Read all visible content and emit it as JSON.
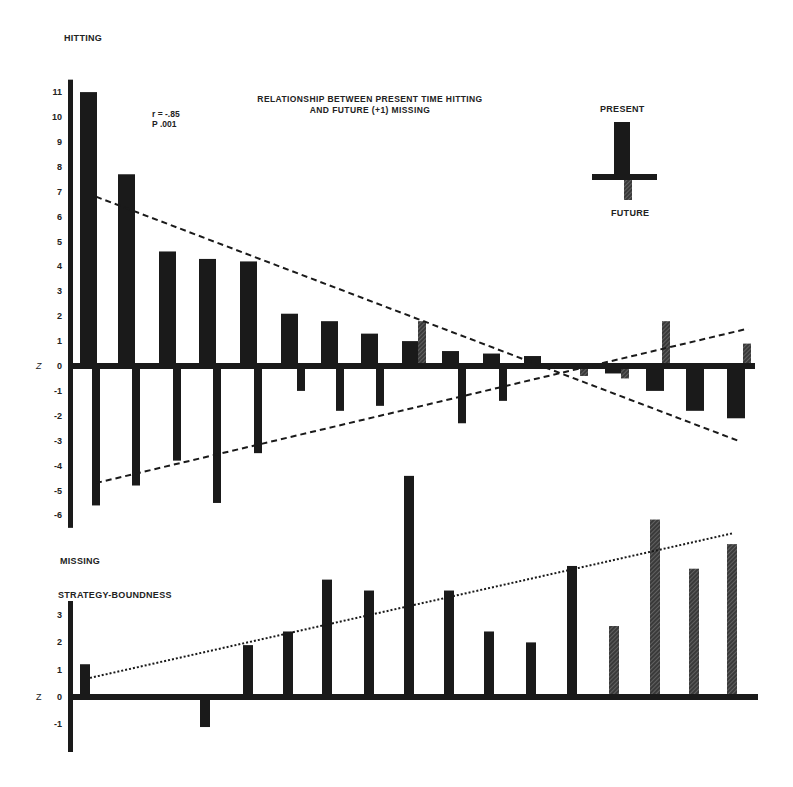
{
  "title": {
    "line1": "RELATIONSHIP BETWEEN PRESENT TIME HITTING",
    "line2": "AND FUTURE (+1) MISSING"
  },
  "stats": {
    "r": "r = -.85",
    "p": "P .001"
  },
  "legend": {
    "top_label": "PRESENT",
    "bottom_label": "FUTURE"
  },
  "labels": {
    "hitting": "HITTING",
    "missing": "MISSING",
    "strategy": "STRATEGY-BOUNDNESS",
    "z_top": "Z",
    "z_bottom": "Z"
  },
  "colors": {
    "ink": "#1a1a1a",
    "hatched": "#3a3a3a",
    "background": "#ffffff"
  },
  "chart_data": [
    {
      "type": "bar",
      "title": "RELATIONSHIP BETWEEN PRESENT TIME HITTING AND FUTURE (+1) MISSING",
      "xlabel": "",
      "ylabel": "HITTING (up) / MISSING (down), Z",
      "ylim": [
        -6,
        11
      ],
      "yticks": [
        11,
        10,
        9,
        8,
        7,
        6,
        5,
        4,
        3,
        2,
        1,
        0,
        -1,
        -2,
        -3,
        -4,
        -5,
        -6
      ],
      "grid": false,
      "legend_position": "top-right",
      "annotations": [
        "r = -.85",
        "P .001"
      ],
      "categories": [
        "1",
        "2",
        "3",
        "4",
        "5",
        "6",
        "7",
        "8",
        "9",
        "10",
        "11",
        "12",
        "13",
        "14",
        "15",
        "16"
      ],
      "series": [
        {
          "name": "PRESENT (Hitting)",
          "style": "solid",
          "values": [
            11.0,
            7.7,
            4.6,
            4.3,
            4.2,
            2.1,
            1.8,
            1.3,
            1.0,
            0.6,
            0.5,
            0.4,
            0.1,
            -0.3,
            -1.0,
            -1.8,
            -2.1
          ]
        },
        {
          "name": "FUTURE +1 (Missing)",
          "style": "hatched",
          "values": [
            -5.6,
            -4.8,
            -3.8,
            -5.5,
            -3.5,
            -1.0,
            -1.8,
            -1.6,
            1.8,
            -2.3,
            -1.4,
            0.0,
            -0.4,
            -0.5,
            1.8,
            0.9
          ]
        }
      ],
      "trendlines": [
        {
          "name": "Hitting trend",
          "style": "dashed",
          "from": [
            1,
            6.8
          ],
          "to": [
            16,
            -3.0
          ]
        },
        {
          "name": "Missing trend",
          "style": "dashed",
          "from": [
            1,
            -4.7
          ],
          "to": [
            16,
            1.5
          ]
        }
      ]
    },
    {
      "type": "bar",
      "title": "STRATEGY-BOUNDNESS",
      "xlabel": "",
      "ylabel": "Z",
      "ylim": [
        -1.5,
        3.5
      ],
      "yticks": [
        3,
        2,
        1,
        0,
        -1
      ],
      "grid": false,
      "categories": [
        "1",
        "2",
        "3",
        "4",
        "5",
        "6",
        "7",
        "8",
        "9",
        "10",
        "11",
        "12",
        "13",
        "14",
        "15",
        "16"
      ],
      "series": [
        {
          "name": "Strategy-Boundness",
          "values": [
            1.2,
            0.1,
            0.1,
            -1.1,
            1.9,
            2.4,
            4.3,
            3.9,
            8.1,
            3.9,
            2.4,
            2.0,
            4.8,
            2.6,
            6.5,
            4.7,
            5.6
          ]
        }
      ],
      "trendlines": [
        {
          "name": "Strategy trend",
          "style": "dotted",
          "from": [
            1,
            0.7
          ],
          "to": [
            16,
            5.4
          ]
        }
      ]
    }
  ]
}
